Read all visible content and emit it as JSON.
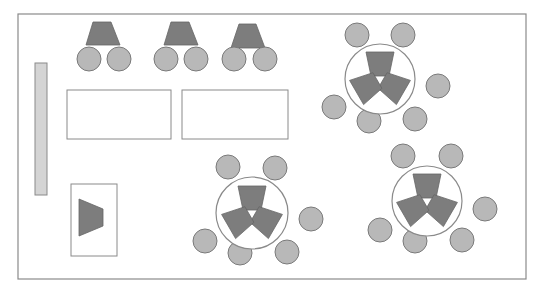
{
  "diagram": {
    "title": "Classroom seating layout",
    "room": {
      "x": 18,
      "y": 14,
      "w": 508,
      "h": 265
    },
    "board": {
      "x": 35,
      "y": 63,
      "w": 12,
      "h": 132
    },
    "teacher_area": {
      "x": 71,
      "y": 184,
      "w": 46,
      "h": 72,
      "desk": [
        [
          79,
          199
        ],
        [
          103,
          209
        ],
        [
          103,
          226
        ],
        [
          79,
          236
        ]
      ]
    },
    "tables": [
      {
        "x": 67,
        "y": 90,
        "w": 104,
        "h": 49
      },
      {
        "x": 182,
        "y": 90,
        "w": 106,
        "h": 49
      }
    ],
    "pair_desks": [
      {
        "desk": [
          [
            93,
            22
          ],
          [
            111,
            22
          ],
          [
            120,
            45
          ],
          [
            86,
            45
          ]
        ],
        "seats": [
          [
            89,
            59
          ],
          [
            119,
            59
          ]
        ]
      },
      {
        "desk": [
          [
            171,
            22
          ],
          [
            189,
            22
          ],
          [
            198,
            45
          ],
          [
            164,
            45
          ]
        ],
        "seats": [
          [
            166,
            59
          ],
          [
            196,
            59
          ]
        ]
      },
      {
        "desk": [
          [
            239,
            24
          ],
          [
            256,
            24
          ],
          [
            265,
            48
          ],
          [
            231,
            48
          ]
        ],
        "seats": [
          [
            234,
            59
          ],
          [
            265,
            59
          ]
        ]
      }
    ],
    "groups": [
      {
        "cx": 380,
        "cy": 79,
        "r": 35,
        "seats": [
          [
            357,
            35
          ],
          [
            403,
            35
          ],
          [
            438,
            86
          ],
          [
            334,
            107
          ],
          [
            369,
            121
          ],
          [
            415,
            119
          ]
        ]
      },
      {
        "cx": 252,
        "cy": 213,
        "r": 36,
        "seats": [
          [
            228,
            167
          ],
          [
            275,
            168
          ],
          [
            311,
            219
          ],
          [
            205,
            241
          ],
          [
            240,
            253
          ],
          [
            287,
            252
          ]
        ]
      },
      {
        "cx": 427,
        "cy": 201,
        "r": 35,
        "seats": [
          [
            403,
            156
          ],
          [
            451,
            156
          ],
          [
            485,
            209
          ],
          [
            380,
            230
          ],
          [
            415,
            241
          ],
          [
            462,
            240
          ]
        ]
      }
    ],
    "colors": {
      "desk": "#7d7d7d",
      "seat": "#b8b8b8",
      "board": "#d4d4d4",
      "stroke": "#8a8a8a"
    }
  }
}
